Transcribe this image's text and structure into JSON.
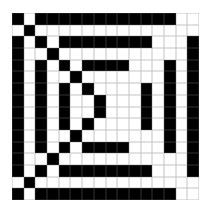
{
  "pattern": {
    "rows": 16,
    "cols": 16,
    "colors": {
      "filled": "#000000",
      "empty": "#ffffff",
      "gridline": "#c4c4c4"
    },
    "cells": [
      "1011111111111100",
      "0100000000000000",
      "1010111111110001",
      "1001000000000001",
      "1010101111000101",
      "1010010000000101",
      "1010101000010101",
      "1010100100010101",
      "1010100100010101",
      "1010101000010101",
      "1010010000000101",
      "1010101111000101",
      "1001000000000001",
      "1010111111110001",
      "0100000000000000",
      "1011111111111100"
    ]
  }
}
